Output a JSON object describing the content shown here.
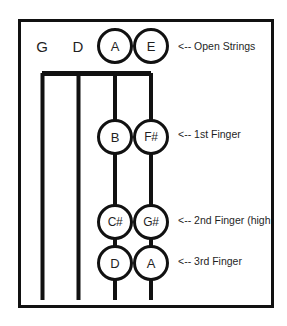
{
  "diagram": {
    "background_color": "#ffffff",
    "line_color": "#111111",
    "text_color": "#1f1f1f",
    "strings": [
      {
        "name": "G",
        "label": "G",
        "x": 42,
        "open_circled": false
      },
      {
        "name": "D",
        "label": "D",
        "x": 78,
        "open_circled": false
      },
      {
        "name": "A",
        "label": "A",
        "x": 115,
        "open_circled": true
      },
      {
        "name": "E",
        "label": "E",
        "x": 151,
        "open_circled": true
      }
    ],
    "rows": [
      {
        "id": "open",
        "y": 46,
        "annotation": "<-- Open Strings",
        "notes": [
          {
            "string": "A",
            "label": "A",
            "x": 115
          },
          {
            "string": "E",
            "label": "E",
            "x": 151
          }
        ]
      },
      {
        "id": "first-finger",
        "y": 137,
        "annotation": "<-- 1st Finger",
        "annotation_y": 134,
        "notes": [
          {
            "string": "A",
            "label": "B",
            "x": 115
          },
          {
            "string": "E",
            "label": "F#",
            "x": 151
          }
        ]
      },
      {
        "id": "second-finger",
        "y": 222,
        "annotation": "<-- 2nd Finger (high",
        "annotation_y": 220,
        "annotation_clipped": true,
        "notes": [
          {
            "string": "A",
            "label": "C#",
            "x": 115
          },
          {
            "string": "E",
            "label": "G#",
            "x": 151
          }
        ]
      },
      {
        "id": "third-finger",
        "y": 263,
        "annotation": "<-- 3rd Finger",
        "annotation_y": 261,
        "notes": [
          {
            "string": "A",
            "label": "D",
            "x": 115
          },
          {
            "string": "E",
            "label": "A",
            "x": 151
          }
        ]
      }
    ],
    "labels": {
      "open_strings": "<-- Open Strings",
      "first_finger": "<-- 1st Finger",
      "second_finger": "<-- 2nd Finger (high",
      "third_finger": "<-- 3rd Finger"
    },
    "string_label_y": 46,
    "nut_y": 73,
    "string_bottom_y": 300,
    "circle_radius": 17
  }
}
